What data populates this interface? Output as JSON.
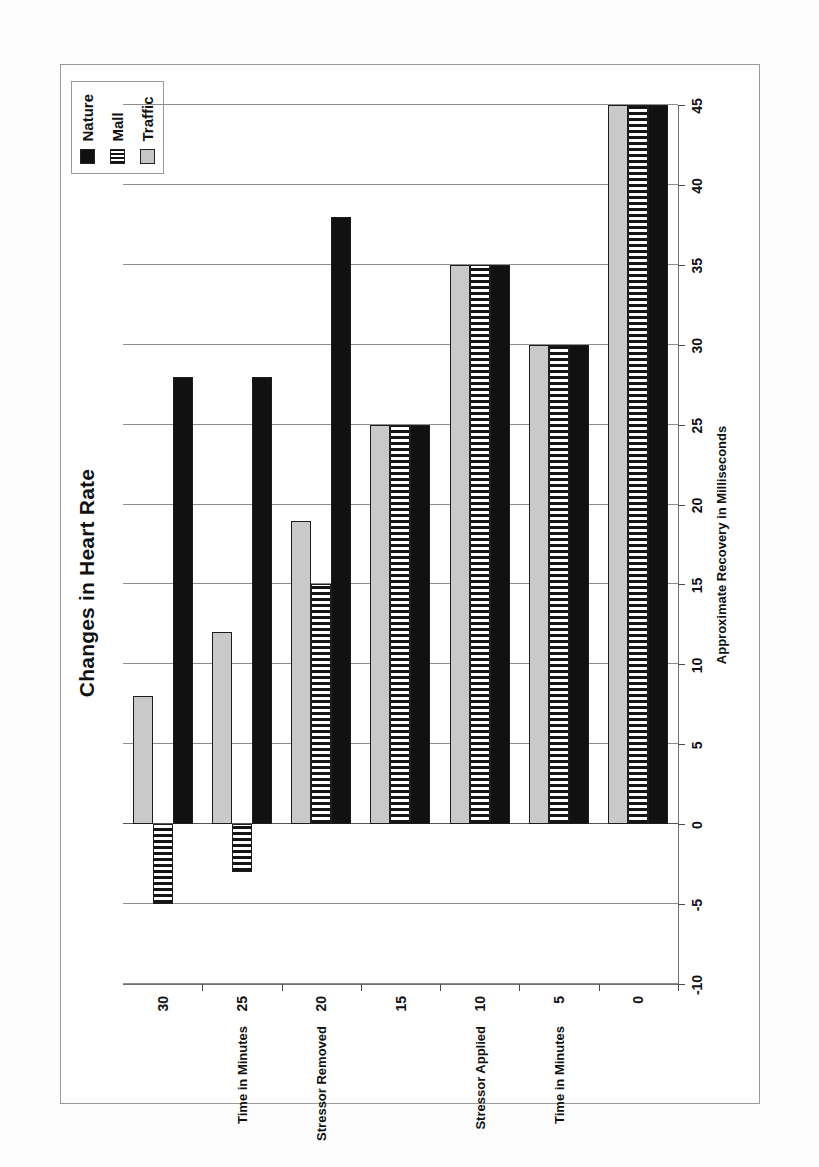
{
  "chart_data": {
    "type": "bar",
    "orientation": "vertical-grouped",
    "title": "Changes in Heart Rate",
    "xlabel": "Time in Minutes",
    "ylabel": "Approximate Recovery in Milliseconds",
    "categories": [
      "0",
      "5",
      "10",
      "15",
      "20",
      "25",
      "30"
    ],
    "category_notes": [
      {
        "category": "5",
        "note": "Time in Minutes"
      },
      {
        "category": "10",
        "note": "Stressor Applied"
      },
      {
        "category": "20",
        "note": "Stressor Removed"
      },
      {
        "category": "25",
        "note": "Time in Minutes"
      }
    ],
    "series": [
      {
        "name": "Nature",
        "color": "#111111",
        "pattern": "solid-black",
        "values": [
          45,
          30,
          35,
          25,
          38,
          28,
          28
        ]
      },
      {
        "name": "Mall",
        "color": "#111111",
        "pattern": "vertical-stripes",
        "values": [
          45,
          30,
          35,
          25,
          15,
          -3,
          -5
        ]
      },
      {
        "name": "Traffic",
        "color": "#c9c9c9",
        "pattern": "solid-gray",
        "values": [
          45,
          30,
          35,
          25,
          19,
          12,
          8
        ]
      }
    ],
    "ylim": [
      -10,
      45
    ],
    "yticks": [
      -10,
      -5,
      0,
      5,
      10,
      15,
      20,
      25,
      30,
      35,
      40,
      45
    ],
    "ytick_labels": [
      "-10",
      "-5",
      "0",
      "5",
      "10",
      "15",
      "20",
      "25",
      "30",
      "35",
      "40",
      "45"
    ],
    "grid": true,
    "legend_position": "top-right"
  },
  "legend": {
    "items": [
      {
        "label": "Nature",
        "swatch": "legend-swatch-nature"
      },
      {
        "label": "Mall",
        "swatch": "legend-swatch-mall"
      },
      {
        "label": "Traffic",
        "swatch": "legend-swatch-traffic"
      }
    ]
  }
}
